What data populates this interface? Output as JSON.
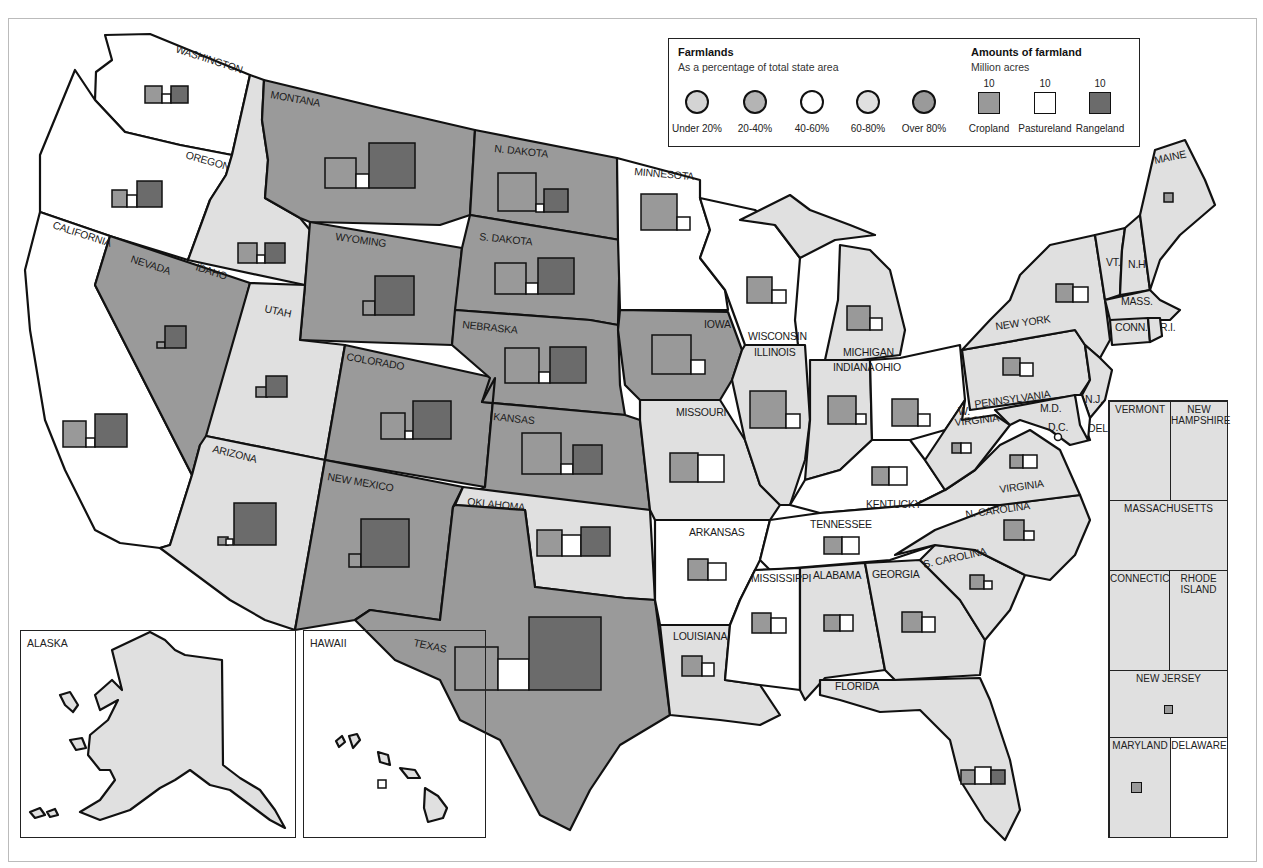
{
  "colors": {
    "under20": "#d4d4d4",
    "p20_40": "#b4b4b4",
    "p40_60": "#ffffff",
    "p60_80": "#e0e0e0",
    "over80": "#9a9a9a",
    "cropland": "#999999",
    "pastureland": "#ffffff",
    "rangeland": "#6b6b6b",
    "stroke": "#111111"
  },
  "legend": {
    "farmlands_title": "Farmlands",
    "farmlands_subtitle": "As a percentage of total state area",
    "categories": [
      {
        "label": "Under 20%",
        "key": "under20"
      },
      {
        "label": "20-40%",
        "key": "p20_40"
      },
      {
        "label": "40-60%",
        "key": "p40_60"
      },
      {
        "label": "60-80%",
        "key": "p60_80"
      },
      {
        "label": "Over 80%",
        "key": "over80"
      }
    ],
    "amounts_title": "Amounts of farmland",
    "amounts_subtitle": "Million acres",
    "amount_types": [
      {
        "label": "Cropland",
        "value": "10",
        "key": "cropland"
      },
      {
        "label": "Pastureland",
        "value": "10",
        "key": "pastureland"
      },
      {
        "label": "Rangeland",
        "value": "10",
        "key": "rangeland"
      }
    ]
  },
  "states": [
    {
      "name": "WASHINGTON",
      "cat": "p40_60"
    },
    {
      "name": "OREGON",
      "cat": "p40_60"
    },
    {
      "name": "CALIFORNIA",
      "cat": "p40_60"
    },
    {
      "name": "IDAHO",
      "cat": "p60_80"
    },
    {
      "name": "NEVADA",
      "cat": "over80"
    },
    {
      "name": "MONTANA",
      "cat": "over80"
    },
    {
      "name": "WYOMING",
      "cat": "over80"
    },
    {
      "name": "UTAH",
      "cat": "p60_80"
    },
    {
      "name": "COLORADO",
      "cat": "over80"
    },
    {
      "name": "ARIZONA",
      "cat": "p60_80"
    },
    {
      "name": "NEW MEXICO",
      "cat": "over80"
    },
    {
      "name": "N. DAKOTA",
      "cat": "over80"
    },
    {
      "name": "S. DAKOTA",
      "cat": "over80"
    },
    {
      "name": "NEBRASKA",
      "cat": "over80"
    },
    {
      "name": "KANSAS",
      "cat": "over80"
    },
    {
      "name": "OKLAHOMA",
      "cat": "p60_80"
    },
    {
      "name": "TEXAS",
      "cat": "over80"
    },
    {
      "name": "MINNESOTA",
      "cat": "p40_60"
    },
    {
      "name": "IOWA",
      "cat": "over80"
    },
    {
      "name": "MISSOURI",
      "cat": "p60_80"
    },
    {
      "name": "ARKANSAS",
      "cat": "p40_60"
    },
    {
      "name": "LOUISIANA",
      "cat": "p60_80"
    },
    {
      "name": "WISCONSIN",
      "cat": "p40_60"
    },
    {
      "name": "ILLINOIS",
      "cat": "p60_80"
    },
    {
      "name": "MICHIGAN",
      "cat": "p60_80"
    },
    {
      "name": "INDIANA",
      "cat": "p60_80"
    },
    {
      "name": "OHIO",
      "cat": "p40_60"
    },
    {
      "name": "KENTUCKY",
      "cat": "p40_60"
    },
    {
      "name": "TENNESSEE",
      "cat": "p40_60"
    },
    {
      "name": "MISSISSIPPI",
      "cat": "p40_60"
    },
    {
      "name": "ALABAMA",
      "cat": "p60_80"
    },
    {
      "name": "GEORGIA",
      "cat": "p60_80"
    },
    {
      "name": "FLORIDA",
      "cat": "p60_80"
    },
    {
      "name": "S. CAROLINA",
      "cat": "p60_80"
    },
    {
      "name": "N. CAROLINA",
      "cat": "p60_80"
    },
    {
      "name": "VIRGINIA",
      "cat": "p60_80"
    },
    {
      "name": "W. VIRGINIA",
      "cat": "p60_80"
    },
    {
      "name": "PENNSYLVANIA",
      "cat": "p60_80"
    },
    {
      "name": "NEW YORK",
      "cat": "p60_80"
    },
    {
      "name": "VT.",
      "cat": "p60_80"
    },
    {
      "name": "N.H.",
      "cat": "p60_80"
    },
    {
      "name": "MAINE",
      "cat": "p60_80"
    },
    {
      "name": "MASS.",
      "cat": "p60_80"
    },
    {
      "name": "CONN.",
      "cat": "p60_80"
    },
    {
      "name": "R.I.",
      "cat": "p60_80"
    },
    {
      "name": "N.J.",
      "cat": "p60_80"
    },
    {
      "name": "M.D.",
      "cat": "p60_80"
    },
    {
      "name": "D.C.",
      "cat": "p60_80"
    },
    {
      "name": "DEL",
      "cat": "p40_60"
    }
  ],
  "map_labels": {
    "washington": "WASHINGTON",
    "oregon": "OREGON",
    "california": "CALIFORNIA",
    "idaho": "IDAHO",
    "nevada": "NEVADA",
    "montana": "MONTANA",
    "wyoming": "WYOMING",
    "utah": "UTAH",
    "colorado": "COLORADO",
    "arizona": "ARIZONA",
    "new_mexico": "NEW MEXICO",
    "n_dakota": "N. DAKOTA",
    "s_dakota": "S. DAKOTA",
    "nebraska": "NEBRASKA",
    "kansas": "KANSAS",
    "oklahoma": "OKLAHOMA",
    "texas": "TEXAS",
    "minnesota": "MINNESOTA",
    "iowa": "IOWA",
    "missouri": "MISSOURI",
    "arkansas": "ARKANSAS",
    "louisiana": "LOUISIANA",
    "wisconsin": "WISCONSIN",
    "illinois": "ILLINOIS",
    "michigan": "MICHIGAN",
    "indiana": "INDIANA",
    "ohio": "OHIO",
    "kentucky": "KENTUCKY",
    "tennessee": "TENNESSEE",
    "mississippi": "MISSISSIPPI",
    "alabama": "ALABAMA",
    "georgia": "GEORGIA",
    "florida": "FLORIDA",
    "s_carolina": "S. CAROLINA",
    "n_carolina": "N. CAROLINA",
    "virginia": "VIRGINIA",
    "w_virginia_1": "W.",
    "w_virginia_2": "VIRGINIA",
    "pennsylvania": "PENNSYLVANIA",
    "new_york": "NEW YORK",
    "vt": "VT.",
    "nh": "N.H.",
    "maine": "MAINE",
    "mass": "MASS.",
    "conn": "CONN.",
    "ri": "R.I.",
    "nj": "N.J.",
    "md": "M.D.",
    "dc": "D.C.",
    "del": "DEL"
  },
  "insets": {
    "alaska": "ALASKA",
    "hawaii": "HAWAII"
  },
  "northeast_panel": {
    "vermont": "VERMONT",
    "new_hampshire_1": "NEW",
    "new_hampshire_2": "HAMPSHIRE",
    "massachusetts": "MASSACHUSETTS",
    "connecticut": "CONNECTICUT",
    "rhode_island_1": "RHODE",
    "rhode_island_2": "ISLAND",
    "new_jersey": "NEW JERSEY",
    "maryland": "MARYLAND",
    "delaware": "DELAWARE"
  },
  "glyphs_note": "Square glyph sizes approximate million acres of cropland / pastureland / rangeland per state (legend square = 10)"
}
